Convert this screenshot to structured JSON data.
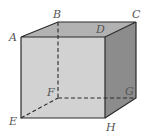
{
  "diagram": {
    "type": "cube",
    "vertices": {
      "A": {
        "label": "A",
        "x": 21,
        "y": 37
      },
      "B": {
        "label": "B",
        "x": 58,
        "y": 22
      },
      "C": {
        "label": "C",
        "x": 136,
        "y": 22
      },
      "D": {
        "label": "D",
        "x": 105,
        "y": 37
      },
      "E": {
        "label": "E",
        "x": 21,
        "y": 118
      },
      "F": {
        "label": "F",
        "x": 58,
        "y": 98
      },
      "G": {
        "label": "G",
        "x": 136,
        "y": 98
      },
      "H": {
        "label": "H",
        "x": 105,
        "y": 118
      }
    },
    "hidden_edges": [
      "BF",
      "EF",
      "FG"
    ],
    "colors": {
      "front_face": "#d2d2d2",
      "top_face": "#b2b2b2",
      "right_face": "#8c8c8c",
      "edge": "#2a2a2a",
      "label": "#555555"
    }
  }
}
